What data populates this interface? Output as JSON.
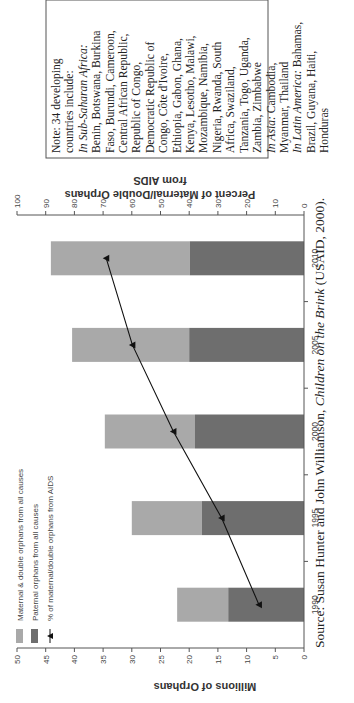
{
  "chart_data": {
    "type": "bar",
    "subtype": "stacked-bar-with-line-secondary-axis",
    "orientation_in_image": "rotated 90 degrees counter-clockwise",
    "categories": [
      "1990",
      "1995",
      "2000",
      "2005",
      "2010"
    ],
    "series": [
      {
        "name": "Paternal orphans from all causes",
        "axis": "left",
        "values": [
          13.2,
          17.8,
          19.0,
          20.0,
          19.9
        ],
        "color": "#6e6e6e"
      },
      {
        "name": "Maternal & double orphans from all causes",
        "axis": "left",
        "values": [
          8.9,
          12.2,
          15.7,
          20.4,
          24.2
        ],
        "stack_totals": [
          22.1,
          30.0,
          34.7,
          40.4,
          44.1
        ],
        "color": "#a9a9a9"
      },
      {
        "name": "% of maternal/double orphans from AIDS",
        "axis": "right",
        "type": "line",
        "marker": "triangle",
        "values": [
          15.7,
          28.7,
          45.5,
          59.8,
          68.9
        ],
        "color": "#111111"
      }
    ],
    "ylabel": "Millions of Orphans",
    "ylim": [
      0,
      50
    ],
    "yticks": [
      0,
      5,
      10,
      15,
      20,
      25,
      30,
      35,
      40,
      45,
      50
    ],
    "y2label": "Percent of Maternal/Double Orphans from AIDS",
    "y2lim": [
      0,
      100
    ],
    "y2ticks": [
      0,
      10,
      20,
      30,
      40,
      50,
      60,
      70,
      80,
      90,
      100
    ],
    "xticks": [
      "1990",
      "1995",
      "2000",
      "2005",
      "2010"
    ],
    "legend": [
      "Maternal & double orphans from all causes",
      "Paternal orphans from all causes",
      "% of maternal/double orphans from AIDS"
    ],
    "legend_position": "upper-left",
    "grid": false
  },
  "axis": {
    "left_label": "Millions of Orphans",
    "right_label_line1": "Percent of Maternal/Double Orphans",
    "right_label_line2": "from AIDS",
    "left_ticks": [
      "0",
      "5",
      "10",
      "15",
      "20",
      "25",
      "30",
      "35",
      "40",
      "45",
      "50"
    ],
    "right_ticks": [
      "0",
      "10",
      "20",
      "30",
      "40",
      "50",
      "60",
      "70",
      "80",
      "90",
      "100"
    ],
    "x_ticks": [
      "1990",
      "1995",
      "2000",
      "2005",
      "2010"
    ]
  },
  "legend": {
    "maternal": "Maternal & double orphans from all causes",
    "paternal": "Paternal orphans from all causes",
    "aids": "% of maternal/double orphans from AIDS"
  },
  "note": {
    "l1": "Note: 34 developing",
    "l2": "countries include:",
    "l3": "In Sub-Saharan Africa:",
    "l4": "Benin, Botswana, Burkina",
    "l5": "Faso, Burundi, Cameroon,",
    "l6": "Central African Republic,",
    "l7": "Republic of Congo,",
    "l8": "Democratic Republic of",
    "l9": "Congo, Côte d'Ivoire,",
    "l10": "Ethiopia, Gabon, Ghana,",
    "l11": "Kenya, Lesotho, Malawi,",
    "l12": "Mozambique, Namibia,",
    "l13": "Nigeria, Rwanda, South",
    "l14": "Africa, Swaziland,",
    "l15": "Tanzania, Togo, Uganda,",
    "l16": "Zambia, Zimbabwe",
    "l17a": "In Asia:",
    "l17b": " Cambodia,",
    "l18": "Myanmar, Thailand",
    "l19a": "In Latin America:",
    "l19b": " Bahamas,",
    "l20": "Brazil, Guyana, Haiti,",
    "l21": "Honduras"
  },
  "source": {
    "prefix": "Source: Susan Hunter and John Williamson, ",
    "title": "Children on the Brink",
    "suffix": " (USAID, 2000)."
  },
  "colors": {
    "maternal": "#a9a9a9",
    "paternal": "#6e6e6e",
    "line": "#111111",
    "axis": "#555555"
  }
}
